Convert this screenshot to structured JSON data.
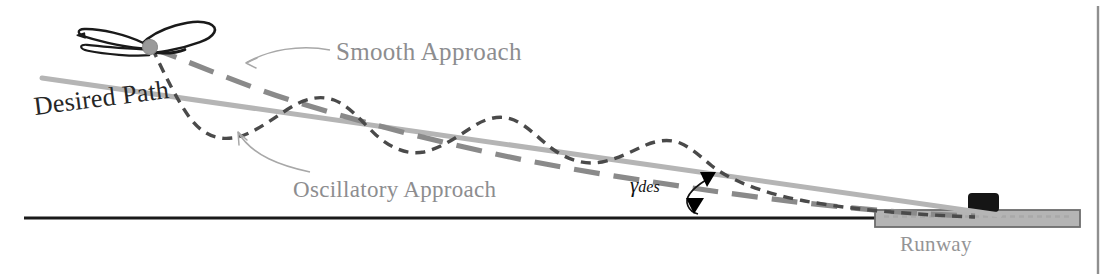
{
  "figure": {
    "width": 1115,
    "height": 280,
    "background_color": "#ffffff"
  },
  "labels": {
    "smooth_approach": "Smooth Approach",
    "oscillatory_approach": "Oscillatory Approach",
    "desired_path": "Desired Path",
    "runway": "Runway",
    "gamma_symbol": "γ",
    "gamma_subscript": "des"
  },
  "colors": {
    "desired_path": "#b5b5b5",
    "smooth_approach": "#8a8a8a",
    "oscillatory_approach": "#4a4a4a",
    "ground_line": "#1a1a1a",
    "runway_fill": "#b4b4b4",
    "runway_border": "#6d6d6d",
    "tower": "#151515",
    "label_gray": "#8d8d8f",
    "label_dark": "#262626",
    "leader_line": "#a8a8a8",
    "arrow_black": "#000000",
    "aircraft_outline": "#1a1a1a",
    "aircraft_hub": "#9a9a9a",
    "frame_line": "#8f8f8f"
  },
  "geometry": {
    "ground_line": {
      "x1": 24,
      "y1": 218,
      "x2": 1080,
      "y2": 218
    },
    "desired_path": {
      "x1": 42,
      "y1": 78,
      "x2": 1000,
      "y2": 215
    },
    "runway": {
      "x": 875,
      "y": 210,
      "width": 205,
      "height": 16
    },
    "tower": {
      "x": 968,
      "y": 194,
      "width": 30,
      "height": 18
    },
    "aircraft_center": {
      "x": 150,
      "y": 47
    },
    "right_frame_line": {
      "x": 1098,
      "y1": 6,
      "y2": 274
    },
    "gamma_vertex": {
      "x": 706,
      "y": 177
    }
  },
  "elements": {
    "aircraft_icon_name": "aircraft-icon",
    "tower_icon_name": "control-tower-icon",
    "gamma_arrow_name": "flight-path-angle-arrow"
  }
}
